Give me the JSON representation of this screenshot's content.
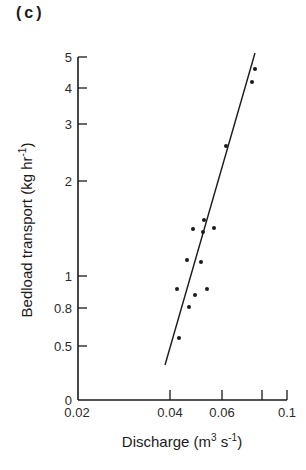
{
  "panel_label": "(c)",
  "chart_data": {
    "type": "scatter",
    "title": "",
    "xlabel": "Discharge (m3 s-1)",
    "ylabel": "Bedload transport (kg hr-1)",
    "x_axis": {
      "scale": "nonlinear",
      "range": [
        0.02,
        0.1
      ],
      "ticks": [
        {
          "value": 0.02,
          "label": "0.02",
          "px": 77
        },
        {
          "value": 0.04,
          "label": "0.04",
          "px": 170
        },
        {
          "value": 0.06,
          "label": "0.06",
          "px": 222
        },
        {
          "value": 0.08,
          "label": "",
          "px": 262
        },
        {
          "value": 0.1,
          "label": "0.1",
          "px": 287
        }
      ]
    },
    "y_axis": {
      "scale": "nonlinear",
      "range": [
        0,
        5
      ],
      "ticks": [
        {
          "value": 0,
          "label": "0",
          "px": 400
        },
        {
          "value": 0.5,
          "label": "0.5",
          "px": 346
        },
        {
          "value": 0.8,
          "label": "0.8",
          "px": 308
        },
        {
          "value": 1,
          "label": "1",
          "px": 276
        },
        {
          "value": 2,
          "label": "2",
          "px": 181
        },
        {
          "value": 3,
          "label": "3",
          "px": 124
        },
        {
          "value": 4,
          "label": "4",
          "px": 88
        },
        {
          "value": 5,
          "label": "5",
          "px": 57
        }
      ]
    },
    "grid": false,
    "legend": null,
    "series": [
      {
        "name": "observations",
        "type": "scatter",
        "points": [
          {
            "x": 0.085,
            "y": 4.6,
            "px": 255,
            "py": 69
          },
          {
            "x": 0.083,
            "y": 4.2,
            "px": 252,
            "py": 82
          },
          {
            "x": 0.062,
            "y": 2.6,
            "px": 226,
            "py": 146
          },
          {
            "x": 0.052,
            "y": 1.55,
            "px": 204,
            "py": 220
          },
          {
            "x": 0.049,
            "y": 1.45,
            "px": 193,
            "py": 229
          },
          {
            "x": 0.052,
            "y": 1.43,
            "px": 203,
            "py": 232
          },
          {
            "x": 0.056,
            "y": 1.47,
            "px": 214,
            "py": 228
          },
          {
            "x": 0.047,
            "y": 1.15,
            "px": 187,
            "py": 260
          },
          {
            "x": 0.052,
            "y": 1.14,
            "px": 201,
            "py": 262
          },
          {
            "x": 0.043,
            "y": 0.92,
            "px": 177,
            "py": 289
          },
          {
            "x": 0.054,
            "y": 0.92,
            "px": 207,
            "py": 289
          },
          {
            "x": 0.05,
            "y": 0.88,
            "px": 195,
            "py": 295
          },
          {
            "x": 0.048,
            "y": 0.81,
            "px": 189,
            "py": 307
          },
          {
            "x": 0.044,
            "y": 0.56,
            "px": 179,
            "py": 338
          }
        ]
      },
      {
        "name": "fitted line",
        "type": "line",
        "points": [
          {
            "x": 0.038,
            "y": 0.33,
            "px": 165,
            "py": 365
          },
          {
            "x": 0.085,
            "y": 5.1,
            "px": 255,
            "py": 53
          }
        ]
      }
    ]
  }
}
